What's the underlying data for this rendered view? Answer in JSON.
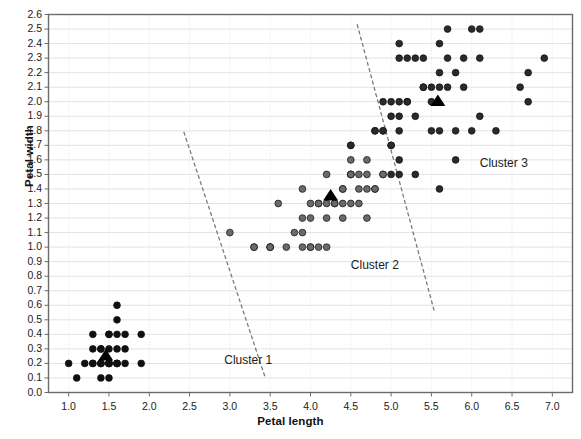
{
  "chart_data": {
    "type": "scatter",
    "title": "",
    "xlabel": "Petal length",
    "ylabel": "Petal width",
    "xlim": [
      0.75,
      7.25
    ],
    "ylim": [
      0.0,
      2.6
    ],
    "xticks": [
      "1.0",
      "1.5",
      "2.0",
      "2.5",
      "3.0",
      "3.5",
      "4.0",
      "4.5",
      "5.0",
      "5.5",
      "6.0",
      "6.5",
      "7.0"
    ],
    "xtick_values": [
      1.0,
      1.5,
      2.0,
      2.5,
      3.0,
      3.5,
      4.0,
      4.5,
      5.0,
      5.5,
      6.0,
      6.5,
      7.0
    ],
    "yticks": [
      "0.0",
      "0.1",
      "0.2",
      "0.3",
      "0.4",
      "0.5",
      "0.6",
      "0.7",
      "0.8",
      "0.9",
      "1.0",
      "1.1",
      "1.2",
      "1.3",
      "1.4",
      "1.5",
      "1.6",
      "1.7",
      "1.8",
      "1.9",
      "2.0",
      "2.1",
      "2.2",
      "2.3",
      "2.4",
      "2.5",
      "2.6"
    ],
    "ytick_values": [
      0.0,
      0.1,
      0.2,
      0.3,
      0.4,
      0.5,
      0.6,
      0.7,
      0.8,
      0.9,
      1.0,
      1.1,
      1.2,
      1.3,
      1.4,
      1.5,
      1.6,
      1.7,
      1.8,
      1.9,
      2.0,
      2.1,
      2.2,
      2.3,
      2.4,
      2.5,
      2.6
    ],
    "grid": true,
    "legend": "none",
    "point_radius": 3.4,
    "series": [
      {
        "name": "Cluster 1",
        "color": "#101010",
        "points": [
          [
            1.1,
            0.1
          ],
          [
            1.4,
            0.1
          ],
          [
            1.5,
            0.1
          ],
          [
            1.0,
            0.2
          ],
          [
            1.2,
            0.2
          ],
          [
            1.3,
            0.2
          ],
          [
            1.3,
            0.2
          ],
          [
            1.4,
            0.2
          ],
          [
            1.4,
            0.2
          ],
          [
            1.4,
            0.2
          ],
          [
            1.5,
            0.2
          ],
          [
            1.5,
            0.2
          ],
          [
            1.5,
            0.2
          ],
          [
            1.5,
            0.2
          ],
          [
            1.6,
            0.2
          ],
          [
            1.6,
            0.2
          ],
          [
            1.6,
            0.2
          ],
          [
            1.7,
            0.2
          ],
          [
            1.9,
            0.2
          ],
          [
            1.3,
            0.3
          ],
          [
            1.4,
            0.3
          ],
          [
            1.4,
            0.3
          ],
          [
            1.5,
            0.3
          ],
          [
            1.6,
            0.3
          ],
          [
            1.7,
            0.3
          ],
          [
            1.3,
            0.4
          ],
          [
            1.5,
            0.4
          ],
          [
            1.5,
            0.4
          ],
          [
            1.6,
            0.4
          ],
          [
            1.7,
            0.4
          ],
          [
            1.9,
            0.4
          ],
          [
            1.6,
            0.5
          ],
          [
            1.6,
            0.6
          ]
        ]
      },
      {
        "name": "Cluster 2",
        "color": "#6a6a6a",
        "points": [
          [
            3.0,
            1.1
          ],
          [
            3.3,
            1.0
          ],
          [
            3.5,
            1.0
          ],
          [
            3.5,
            1.0
          ],
          [
            3.7,
            1.0
          ],
          [
            3.9,
            1.0
          ],
          [
            4.1,
            1.0
          ],
          [
            4.2,
            1.0
          ],
          [
            3.3,
            1.0
          ],
          [
            3.6,
            1.3
          ],
          [
            3.9,
            1.2
          ],
          [
            4.0,
            1.0
          ],
          [
            3.8,
            1.1
          ],
          [
            3.9,
            1.1
          ],
          [
            4.0,
            1.3
          ],
          [
            4.0,
            1.2
          ],
          [
            4.1,
            1.3
          ],
          [
            4.2,
            1.2
          ],
          [
            4.2,
            1.3
          ],
          [
            4.3,
            1.3
          ],
          [
            4.4,
            1.3
          ],
          [
            4.4,
            1.4
          ],
          [
            4.5,
            1.3
          ],
          [
            4.5,
            1.5
          ],
          [
            4.5,
            1.5
          ],
          [
            4.5,
            1.6
          ],
          [
            4.6,
            1.3
          ],
          [
            4.6,
            1.4
          ],
          [
            4.6,
            1.5
          ],
          [
            4.7,
            1.4
          ],
          [
            4.7,
            1.6
          ],
          [
            4.8,
            1.4
          ],
          [
            4.8,
            1.8
          ],
          [
            4.9,
            1.5
          ],
          [
            4.9,
            1.5
          ],
          [
            4.4,
            1.2
          ],
          [
            4.7,
            1.2
          ],
          [
            4.9,
            1.8
          ],
          [
            5.0,
            1.7
          ],
          [
            3.9,
            1.4
          ],
          [
            4.1,
            1.3
          ],
          [
            4.2,
            1.5
          ],
          [
            4.3,
            1.3
          ],
          [
            4.4,
            1.4
          ],
          [
            4.5,
            1.7
          ],
          [
            4.0,
            1.0
          ],
          [
            4.7,
            1.5
          ],
          [
            4.8,
            1.4
          ],
          [
            4.5,
            1.5
          ],
          [
            3.5,
            1.0
          ]
        ]
      },
      {
        "name": "Cluster 3",
        "color": "#2a2a2a",
        "points": [
          [
            4.5,
            1.7
          ],
          [
            4.8,
            1.8
          ],
          [
            4.9,
            2.0
          ],
          [
            5.0,
            1.5
          ],
          [
            5.0,
            1.7
          ],
          [
            5.0,
            1.9
          ],
          [
            5.1,
            1.5
          ],
          [
            5.1,
            1.6
          ],
          [
            5.1,
            1.8
          ],
          [
            5.1,
            1.9
          ],
          [
            5.1,
            2.0
          ],
          [
            5.1,
            2.3
          ],
          [
            5.1,
            2.4
          ],
          [
            5.2,
            2.0
          ],
          [
            5.2,
            2.3
          ],
          [
            5.3,
            1.9
          ],
          [
            5.3,
            2.3
          ],
          [
            5.4,
            2.1
          ],
          [
            5.4,
            2.3
          ],
          [
            5.5,
            1.8
          ],
          [
            5.5,
            2.1
          ],
          [
            5.6,
            1.4
          ],
          [
            5.6,
            1.8
          ],
          [
            5.6,
            2.1
          ],
          [
            5.6,
            2.2
          ],
          [
            5.6,
            2.4
          ],
          [
            5.7,
            2.1
          ],
          [
            5.7,
            2.3
          ],
          [
            5.7,
            2.5
          ],
          [
            5.8,
            1.6
          ],
          [
            5.8,
            1.8
          ],
          [
            5.8,
            2.2
          ],
          [
            5.9,
            2.1
          ],
          [
            5.9,
            2.3
          ],
          [
            6.0,
            1.8
          ],
          [
            6.0,
            2.5
          ],
          [
            6.1,
            1.9
          ],
          [
            6.1,
            2.3
          ],
          [
            6.1,
            2.5
          ],
          [
            6.3,
            1.8
          ],
          [
            6.6,
            2.1
          ],
          [
            6.7,
            2.0
          ],
          [
            6.7,
            2.2
          ],
          [
            6.9,
            2.3
          ],
          [
            5.0,
            2.0
          ],
          [
            5.2,
            2.0
          ],
          [
            5.4,
            2.1
          ],
          [
            5.5,
            2.0
          ],
          [
            4.9,
            1.8
          ],
          [
            5.3,
            1.5
          ]
        ]
      }
    ],
    "centroids": [
      {
        "cluster": "Cluster 1",
        "x": 1.46,
        "y": 0.25,
        "marker": "triangle",
        "color": "#000000"
      },
      {
        "cluster": "Cluster 2",
        "x": 4.25,
        "y": 1.35,
        "marker": "triangle",
        "color": "#000000"
      },
      {
        "cluster": "Cluster 3",
        "x": 5.58,
        "y": 2.0,
        "marker": "triangle",
        "color": "#000000"
      }
    ],
    "dividers": [
      {
        "name": "divider-cluster1-cluster2",
        "x1": 2.43,
        "y1": 1.79,
        "x2": 3.44,
        "y2": 0.1,
        "style": "dashed"
      },
      {
        "name": "divider-cluster2-cluster3",
        "x1": 4.58,
        "y1": 2.53,
        "x2": 5.54,
        "y2": 0.55,
        "style": "dashed"
      }
    ],
    "annotations": [
      {
        "name": "cluster-1-label",
        "text": "Cluster 1",
        "x": 2.93,
        "y": 0.22
      },
      {
        "name": "cluster-2-label",
        "text": "Cluster 2",
        "x": 4.5,
        "y": 0.87
      },
      {
        "name": "cluster-3-label",
        "text": "Cluster 3",
        "x": 6.1,
        "y": 1.57
      }
    ]
  },
  "axes": {
    "x_title": "Petal length",
    "y_title": "Petal width"
  },
  "style": {
    "grid_color": "#e2e2ea",
    "frame_color": "#6b6b6b",
    "background": "#ffffff"
  }
}
